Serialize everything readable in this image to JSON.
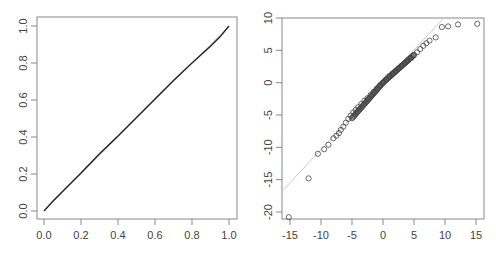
{
  "chart_data": [
    {
      "type": "line",
      "title": "",
      "xlabel": "",
      "ylabel": "",
      "xlim": [
        0.0,
        1.0
      ],
      "ylim": [
        0.0,
        1.0
      ],
      "x_ticks": [
        "0.0",
        "0.2",
        "0.4",
        "0.6",
        "0.8",
        "1.0"
      ],
      "y_ticks": [
        "0.0",
        "0.2",
        "0.4",
        "0.6",
        "0.8",
        "1.0"
      ],
      "grid": false,
      "series": [
        {
          "name": "empirical",
          "color": "#222222",
          "x": [
            0.0,
            0.05,
            0.1,
            0.2,
            0.3,
            0.4,
            0.5,
            0.6,
            0.7,
            0.8,
            0.9,
            0.95,
            1.0
          ],
          "y": [
            0.0,
            0.055,
            0.105,
            0.205,
            0.31,
            0.405,
            0.505,
            0.605,
            0.705,
            0.8,
            0.89,
            0.94,
            1.0
          ]
        },
        {
          "name": "reference",
          "color": "#cccccc",
          "x": [
            0,
            1
          ],
          "y": [
            0,
            1
          ]
        }
      ]
    },
    {
      "type": "scatter",
      "title": "",
      "xlabel": "",
      "ylabel": "",
      "xlim": [
        -16,
        16
      ],
      "ylim": [
        -21.5,
        10.5
      ],
      "x_ticks": [
        "-15",
        "-10",
        "-5",
        "0",
        "5",
        "10",
        "15"
      ],
      "y_ticks": [
        "-20",
        "-15",
        "-10",
        "-5",
        "0",
        "5",
        "10"
      ],
      "grid": false,
      "reference_line": {
        "color": "#cccccc",
        "x": [
          -16,
          10
        ],
        "y": [
          -16.5,
          10.2
        ]
      },
      "series": [
        {
          "name": "quantiles",
          "marker": "open-circle",
          "color": "#444444",
          "x": [
            -15.2,
            -12.0,
            -10.5,
            -9.5,
            -8.8,
            -8.0,
            -7.5,
            -7.1,
            -6.8,
            -6.4,
            -6.0,
            -5.6,
            -5.2,
            -4.8,
            -4.4,
            -4.0,
            -3.5,
            -3.0,
            -2.5,
            -2.0,
            -1.5,
            -1.0,
            -0.5,
            0.0,
            0.5,
            1.0,
            1.5,
            2.0,
            2.5,
            3.0,
            3.5,
            4.0,
            4.5,
            5.0,
            5.5,
            6.0,
            6.5,
            7.0,
            7.5,
            8.5,
            9.5,
            10.5,
            12.1,
            15.2
          ],
          "y": [
            -20.8,
            -14.8,
            -11.0,
            -10.3,
            -9.6,
            -8.6,
            -8.2,
            -7.8,
            -7.3,
            -6.8,
            -6.2,
            -5.6,
            -5.1,
            -4.6,
            -4.2,
            -3.8,
            -3.3,
            -2.8,
            -2.4,
            -1.9,
            -1.4,
            -0.9,
            -0.4,
            0.0,
            0.5,
            1.0,
            1.4,
            1.8,
            2.2,
            2.6,
            3.0,
            3.4,
            3.8,
            4.3,
            4.7,
            5.2,
            5.7,
            6.1,
            6.5,
            7.0,
            8.6,
            8.7,
            9.0,
            9.1
          ]
        }
      ]
    }
  ]
}
